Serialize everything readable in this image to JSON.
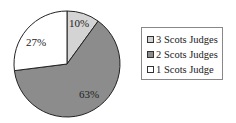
{
  "chart_data": {
    "type": "pie",
    "title": "",
    "categories": [
      "3 Scots Judges",
      "2 Scots Judges",
      "1 Scots Judge"
    ],
    "values": [
      10,
      63,
      27
    ],
    "labels": [
      "10%",
      "63%",
      "27%"
    ],
    "colors": [
      "#d4d4d4",
      "#8c8c8c",
      "#ffffff"
    ],
    "legend_position": "right"
  },
  "legend": {
    "items": [
      {
        "label": "3 Scots Judges",
        "color": "#d4d4d4"
      },
      {
        "label": "2 Scots Judges",
        "color": "#8c8c8c"
      },
      {
        "label": "1 Scots Judge",
        "color": "#ffffff"
      }
    ]
  }
}
